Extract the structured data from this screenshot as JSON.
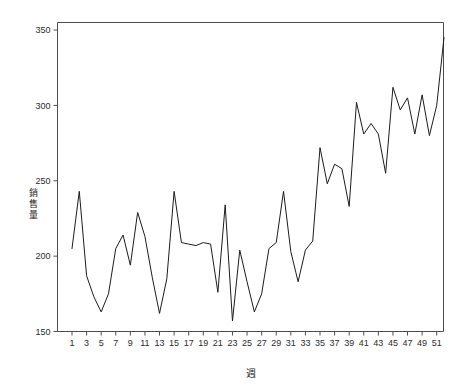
{
  "chart_data": {
    "type": "line",
    "title": "",
    "subtitle": "",
    "xlabel": "週",
    "ylabel": "銷售量",
    "xlim": [
      1,
      52
    ],
    "ylim": [
      150,
      355
    ],
    "grid": false,
    "legend": null,
    "x_tick_labels": [
      "1",
      "3",
      "5",
      "7",
      "9",
      "11",
      "13",
      "15",
      "17",
      "19",
      "21",
      "23",
      "25",
      "27",
      "29",
      "31",
      "33",
      "35",
      "37",
      "39",
      "41",
      "43",
      "45",
      "47",
      "49",
      "51"
    ],
    "y_tick_labels": [
      "150",
      "200",
      "250",
      "300",
      "350"
    ],
    "y_ticks": [
      150,
      200,
      250,
      300,
      350
    ],
    "x_ticks": [
      1,
      3,
      5,
      7,
      9,
      11,
      13,
      15,
      17,
      19,
      21,
      23,
      25,
      27,
      29,
      31,
      33,
      35,
      37,
      39,
      41,
      43,
      45,
      47,
      49,
      51
    ],
    "line_color": "#1c1c1c",
    "axis_color": "#4d4d4d",
    "background_color": "#ffffff",
    "x": [
      1,
      2,
      3,
      4,
      5,
      6,
      7,
      8,
      9,
      10,
      11,
      12,
      13,
      14,
      15,
      16,
      17,
      18,
      19,
      20,
      21,
      22,
      23,
      24,
      25,
      26,
      27,
      28,
      29,
      30,
      31,
      32,
      33,
      34,
      35,
      36,
      37,
      38,
      39,
      40,
      41,
      42,
      43,
      44,
      45,
      46,
      47,
      48,
      49,
      50,
      51,
      52
    ],
    "series": [
      {
        "name": "銷售量",
        "values": [
          205,
          243,
          187,
          173,
          163,
          175,
          205,
          214,
          194,
          229,
          213,
          186,
          162,
          185,
          243,
          209,
          208,
          207,
          209,
          208,
          176,
          234,
          157,
          204,
          183,
          163,
          175,
          205,
          209,
          243,
          203,
          183,
          204,
          210,
          272,
          248,
          261,
          258,
          233,
          302,
          281,
          288,
          281,
          255,
          312,
          297,
          305,
          281,
          307,
          280,
          300,
          345
        ]
      }
    ]
  }
}
